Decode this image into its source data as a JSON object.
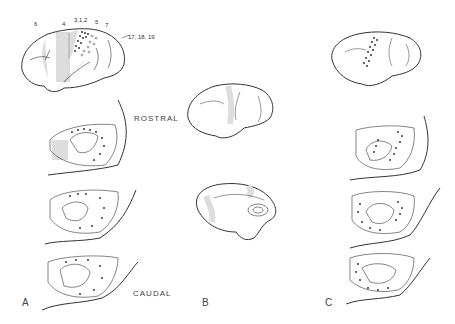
{
  "figure": {
    "panels": [
      {
        "id": "A",
        "label": "A"
      },
      {
        "id": "B",
        "label": "B"
      },
      {
        "id": "C",
        "label": "C"
      }
    ],
    "orientation": {
      "rostral": "ROSTRAL",
      "caudal": "CAUDAL"
    },
    "area_labels": {
      "a6": "6",
      "a4": "4",
      "a312": "3,1,2",
      "a5": "5",
      "a7": "7",
      "a171819": "17, 18, 19"
    },
    "colors": {
      "line": "#333333",
      "shade": "#d8d8d8",
      "background": "#ffffff"
    }
  }
}
